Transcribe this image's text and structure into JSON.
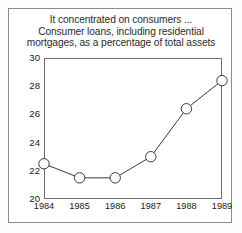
{
  "figure": {
    "title_lines": [
      "It concentrated on consumers ...",
      "Consumer loans, including residential",
      "mortgages, as a percentage of total assets"
    ],
    "frame_color": "#8a8a8a",
    "axis_color": "#6d6d6d",
    "line_color": "#3a3a3a",
    "marker_fill": "#ffffff",
    "background": "#ffffff"
  },
  "chart_data": {
    "type": "line",
    "title": "It concentrated on consumers ... Consumer loans, including residential mortgages, as a percentage of total assets",
    "xlabel": "",
    "ylabel": "",
    "categories": [
      "1984",
      "1985",
      "1986",
      "1987",
      "1988",
      "1989"
    ],
    "x": [
      1984,
      1985,
      1986,
      1987,
      1988,
      1989
    ],
    "values": [
      22.5,
      21.5,
      21.5,
      23.0,
      26.4,
      28.4
    ],
    "series": [
      {
        "name": "Consumer loans as a percentage of total assets",
        "values": [
          22.5,
          21.5,
          21.5,
          23.0,
          26.4,
          28.4
        ]
      }
    ],
    "ylim": [
      20,
      30
    ],
    "yticks": [
      20,
      22,
      24,
      26,
      28,
      30
    ],
    "ytick_labels": [
      "20",
      "22",
      "24",
      "26",
      "28",
      "30"
    ],
    "xticks": [
      1984,
      1985,
      1986,
      1987,
      1988,
      1989
    ],
    "xtick_labels": [
      "1984",
      "1985",
      "1986",
      "1987",
      "1988",
      "1989"
    ],
    "grid": false,
    "legend": false,
    "marker": "open-circle"
  }
}
